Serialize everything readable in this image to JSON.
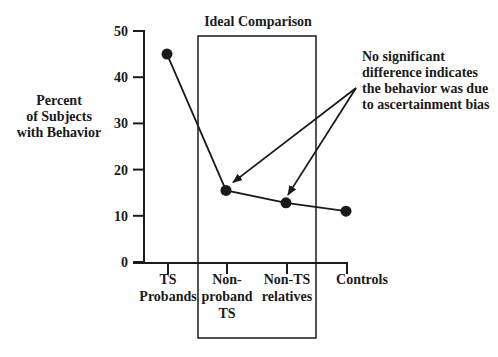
{
  "chart_data": {
    "type": "line",
    "title": "",
    "xlabel": "",
    "ylabel": "Percent of Subjects with Behavior",
    "ylabel_lines": [
      "Percent",
      "of Subjects",
      "with Behavior"
    ],
    "ylim": [
      0,
      50
    ],
    "yticks": [
      0,
      10,
      20,
      30,
      40,
      50
    ],
    "grid": false,
    "categories": [
      "TS Probands",
      "Non-proband TS",
      "Non-TS relatives",
      "Controls"
    ],
    "category_lines": [
      [
        "TS",
        "Probands"
      ],
      [
        "Non-",
        "proband",
        "TS"
      ],
      [
        "Non-TS",
        "relatives"
      ],
      [
        "Controls"
      ]
    ],
    "series": [
      {
        "name": "Percent with behavior",
        "values": [
          45,
          15.5,
          12.8,
          11
        ]
      }
    ],
    "highlight_box": {
      "label": "Ideal Comparison",
      "encloses": [
        "Non-proband TS",
        "Non-TS relatives"
      ]
    },
    "annotation": {
      "lines": [
        "No significant",
        "difference indicates",
        "the behavior was due",
        "to ascertainment bias"
      ],
      "arrows_to": [
        "Non-proband TS",
        "Non-TS relatives"
      ]
    }
  },
  "colors": {
    "ink": "#1a1a1a",
    "background": "#ffffff"
  }
}
